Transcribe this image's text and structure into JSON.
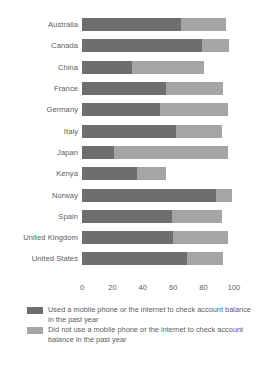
{
  "chart_data": {
    "type": "bar",
    "orientation": "horizontal",
    "stacked": true,
    "title": "",
    "subtitle": "",
    "xlabel": "",
    "ylabel": "",
    "xlim": [
      0,
      100
    ],
    "xticks": [
      "0",
      "20",
      "40",
      "60",
      "80",
      "100"
    ],
    "xtick_values": [
      0,
      20,
      40,
      60,
      80,
      100
    ],
    "grid": false,
    "legend_position": "bottom-left",
    "categories": [
      "Australia",
      "Canada",
      "China",
      "France",
      "Germany",
      "Italy",
      "Japan",
      "Kenya",
      "Norway",
      "Spain",
      "United Kingdom",
      "United States"
    ],
    "series": [
      {
        "name": "Used a mobile phone or the internet to check account balance in the past year",
        "color": "#6e6e6e",
        "values": [
          65,
          79,
          33,
          55,
          51,
          62,
          21,
          36,
          88,
          59,
          60,
          69
        ]
      },
      {
        "name": "Did not use a mobile phone or the internet to check account balance in the past year",
        "color": "#a5a5a5",
        "values": [
          30,
          18,
          47,
          38,
          45,
          30,
          75,
          19,
          11,
          33,
          36,
          24
        ]
      }
    ],
    "totals": [
      95,
      97,
      80,
      93,
      96,
      92,
      96,
      55,
      99,
      92,
      96,
      93
    ]
  },
  "legend": {
    "items": [
      {
        "swatch": "used",
        "label": "Used a mobile phone or the internet to check account balance in the past year"
      },
      {
        "swatch": "notused",
        "label": "Did not use a mobile phone or the internet to check account balance in the past year"
      }
    ]
  },
  "colors": {
    "used": "#6e6e6e",
    "not_used": "#a5a5a5",
    "text": "#5d5d5f",
    "background": "#ffffff"
  }
}
